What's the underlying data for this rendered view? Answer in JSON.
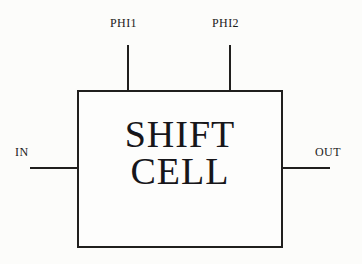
{
  "diagram": {
    "background_color": "#fcfcfa",
    "line_color": "#201f1d",
    "text_color": "#17161a",
    "block": {
      "name": "shift-cell",
      "label_line1": "SHIFT",
      "label_line2": "CELL"
    },
    "ports": [
      {
        "id": "phi1",
        "label": "PHI1",
        "side": "top",
        "direction": "input"
      },
      {
        "id": "phi2",
        "label": "PHI2",
        "side": "top",
        "direction": "input"
      },
      {
        "id": "in",
        "label": "IN",
        "side": "left",
        "direction": "input"
      },
      {
        "id": "out",
        "label": "OUT",
        "side": "right",
        "direction": "output"
      }
    ]
  }
}
